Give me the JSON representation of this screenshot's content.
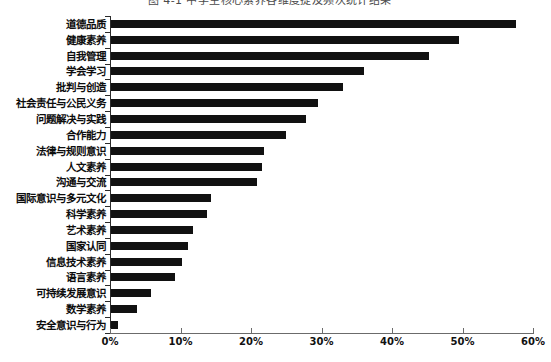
{
  "figure": {
    "title_partial": "图 4-1 中学生核心素养各维度提及频次统计结果",
    "background_color": "#ffffff",
    "bar_color": "#111111",
    "axis_color": "#6b6b6b"
  },
  "chart_data": {
    "type": "bar",
    "orientation": "horizontal",
    "title": "图 4-1 中学生核心素养各维度提及频次统计结果",
    "xlabel": "",
    "ylabel": "",
    "xlim": [
      0,
      60
    ],
    "grid": false,
    "legend": null,
    "xticks": [
      "0%",
      "10%",
      "20%",
      "30%",
      "40%",
      "50%",
      "60%"
    ],
    "xtick_values": [
      0,
      10,
      20,
      30,
      40,
      50,
      60
    ],
    "categories": [
      "道德品质",
      "健康素养",
      "自我管理",
      "学会学习",
      "批判与创造",
      "社会责任与公民义务",
      "问题解决与实践",
      "合作能力",
      "法律与规则意识",
      "人文素养",
      "沟通与交流",
      "国际意识与多元文化",
      "科学素养",
      "艺术素养",
      "国家认同",
      "信息技术素养",
      "语言素养",
      "可持续发展意识",
      "数学素养",
      "安全意识与行为"
    ],
    "values": [
      57.6,
      49.5,
      45.2,
      36.0,
      33.0,
      29.5,
      27.8,
      25.0,
      21.8,
      21.5,
      20.8,
      14.3,
      13.8,
      11.8,
      11.0,
      10.2,
      9.2,
      5.8,
      3.8,
      1.2
    ],
    "units": "percent"
  }
}
